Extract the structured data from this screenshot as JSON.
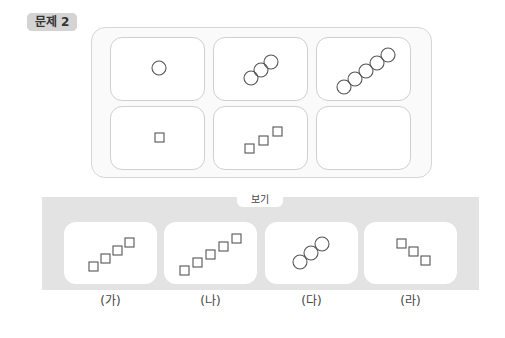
{
  "problem": {
    "label": "문제 2"
  },
  "sequence": {
    "cells": [
      {
        "shape": "circle",
        "count": 1
      },
      {
        "shape": "circle",
        "count": 3
      },
      {
        "shape": "circle",
        "count": 5
      },
      {
        "shape": "square",
        "count": 1
      },
      {
        "shape": "square",
        "count": 3
      },
      {
        "shape": "empty",
        "count": 0
      }
    ]
  },
  "options": {
    "tab_label": "보기",
    "items": [
      {
        "label": "(가)",
        "shape": "square",
        "count": 4,
        "direction": "up-right"
      },
      {
        "label": "(나)",
        "shape": "square",
        "count": 5,
        "direction": "up-right"
      },
      {
        "label": "(다)",
        "shape": "circle",
        "count": 3,
        "direction": "up-right"
      },
      {
        "label": "(라)",
        "shape": "square",
        "count": 3,
        "direction": "down-right"
      }
    ]
  }
}
